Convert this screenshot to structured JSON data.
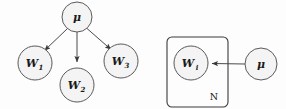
{
  "figure": {
    "background_color": "#fdfdfd",
    "node_fill": "#f4f4f4",
    "node_stroke": "#5a5a5a",
    "edge_color": "#4a4a4a",
    "plate_stroke": "#3b3b3b",
    "text_color": "#1a1a1a"
  },
  "left_panel": {
    "name": "expanded-graph",
    "parent": {
      "label": "μ",
      "subscript": "",
      "cx": 77,
      "cy": 17,
      "r": 15
    },
    "children": [
      {
        "label": "W",
        "subscript": "1",
        "cx": 35,
        "cy": 63,
        "r": 17
      },
      {
        "label": "W",
        "subscript": "2",
        "cx": 77,
        "cy": 85,
        "r": 17
      },
      {
        "label": "W",
        "subscript": "3",
        "cx": 121,
        "cy": 61,
        "r": 17
      }
    ],
    "edges": [
      {
        "from": "μ",
        "to": "W1",
        "arrow": true
      },
      {
        "from": "μ",
        "to": "W2",
        "arrow": true
      },
      {
        "from": "μ",
        "to": "W3",
        "arrow": true
      }
    ]
  },
  "right_panel": {
    "name": "plate-graph",
    "plate": {
      "label": "N",
      "x": 167,
      "y": 37,
      "width": 61,
      "height": 70,
      "rx": 5,
      "label_x": 214,
      "label_y": 96
    },
    "inner_node": {
      "label": "W",
      "subscript": "i",
      "cx": 191,
      "cy": 63,
      "r": 17
    },
    "outer_node": {
      "label": "μ",
      "subscript": "",
      "cx": 261,
      "cy": 64,
      "r": 16
    },
    "edges": [
      {
        "from": "μ",
        "to": "Wi",
        "arrow": true,
        "direction": "left"
      }
    ]
  }
}
